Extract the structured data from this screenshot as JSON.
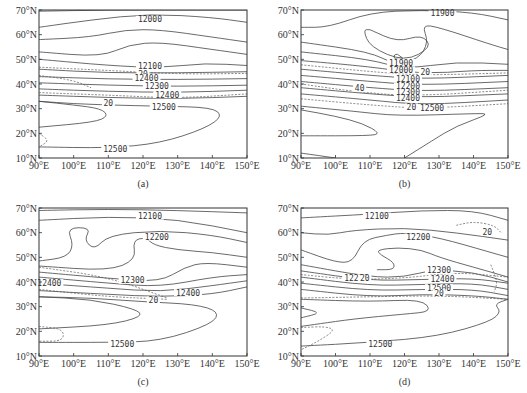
{
  "chart_data": [
    {
      "type": "contour",
      "panel": "a",
      "caption": "(a)",
      "xlim": [
        90,
        150
      ],
      "ylim": [
        10,
        70
      ],
      "xticks": [
        "90°E",
        "100°E",
        "110°E",
        "120°E",
        "130°E",
        "140°E",
        "150°E"
      ],
      "yticks": [
        "10°N",
        "20°N",
        "30°N",
        "40°N",
        "50°N",
        "60°N",
        "70°N"
      ],
      "solid_levels": [
        12000,
        12100,
        12200,
        12300,
        12400,
        12500
      ],
      "dashed_levels": [
        20
      ],
      "labels": [
        {
          "text": "12000",
          "lon": 122,
          "lat": 66
        },
        {
          "text": "12100",
          "lon": 122,
          "lat": 47
        },
        {
          "text": "20",
          "lon": 120,
          "lat": 43.8
        },
        {
          "text": "12400",
          "lon": 121,
          "lat": 42.3
        },
        {
          "text": "12300",
          "lon": 124,
          "lat": 39
        },
        {
          "text": "12400",
          "lon": 127,
          "lat": 35.5
        },
        {
          "text": "20",
          "lon": 110,
          "lat": 32
        },
        {
          "text": "12500",
          "lon": 126,
          "lat": 30.5
        },
        {
          "text": "12500",
          "lon": 112,
          "lat": 13.5
        }
      ]
    },
    {
      "type": "contour",
      "panel": "b",
      "caption": "(b)",
      "xlim": [
        90,
        150
      ],
      "ylim": [
        10,
        70
      ],
      "xticks": [
        "90°E",
        "100°E",
        "110°E",
        "120°E",
        "130°E",
        "140°E",
        "150°E"
      ],
      "yticks": [
        "10°N",
        "20°N",
        "30°N",
        "40°N",
        "50°N",
        "60°N",
        "70°N"
      ],
      "solid_levels": [
        11900,
        12000,
        12100,
        12200,
        12300,
        12400,
        12500
      ],
      "dashed_levels": [
        20,
        40
      ],
      "labels": [
        {
          "text": "11900",
          "lon": 131,
          "lat": 68.5
        },
        {
          "text": "11900",
          "lon": 119,
          "lat": 48.5
        },
        {
          "text": "12000",
          "lon": 119,
          "lat": 45.5
        },
        {
          "text": "20",
          "lon": 126,
          "lat": 44.5
        },
        {
          "text": "12100",
          "lon": 121,
          "lat": 42
        },
        {
          "text": "40",
          "lon": 107,
          "lat": 38
        },
        {
          "text": "12200",
          "lon": 121,
          "lat": 38.8
        },
        {
          "text": "12300",
          "lon": 121,
          "lat": 36.5
        },
        {
          "text": "12400",
          "lon": 121,
          "lat": 34
        },
        {
          "text": "20",
          "lon": 122,
          "lat": 30.5
        },
        {
          "text": "12500",
          "lon": 128,
          "lat": 30
        }
      ]
    },
    {
      "type": "contour",
      "panel": "c",
      "caption": "(c)",
      "xlim": [
        90,
        150
      ],
      "ylim": [
        10,
        70
      ],
      "xticks": [
        "90°E",
        "100°E",
        "110°E",
        "120°E",
        "130°E",
        "140°E",
        "150°E"
      ],
      "yticks": [
        "10°N",
        "20°N",
        "30°N",
        "40°N",
        "50°N",
        "60°N",
        "70°N"
      ],
      "solid_levels": [
        12100,
        12200,
        12300,
        12400,
        12500
      ],
      "dashed_levels": [
        20
      ],
      "labels": [
        {
          "text": "12100",
          "lon": 122,
          "lat": 66.5
        },
        {
          "text": "12200",
          "lon": 124,
          "lat": 58
        },
        {
          "text": "12300",
          "lon": 117,
          "lat": 40.5
        },
        {
          "text": "12400",
          "lon": 93,
          "lat": 39.5
        },
        {
          "text": "12400",
          "lon": 133,
          "lat": 35.5
        },
        {
          "text": "20",
          "lon": 123,
          "lat": 32.5
        },
        {
          "text": "12500",
          "lon": 114,
          "lat": 14.5
        }
      ]
    },
    {
      "type": "contour",
      "panel": "d",
      "caption": "(d)",
      "xlim": [
        90,
        150
      ],
      "ylim": [
        10,
        70
      ],
      "xticks": [
        "90°E",
        "100°E",
        "110°E",
        "120°E",
        "130°E",
        "140°E",
        "150°E"
      ],
      "yticks": [
        "10°N",
        "20°N",
        "30°N",
        "40°N",
        "50°N",
        "60°N",
        "70°N"
      ],
      "solid_levels": [
        12100,
        12200,
        12300,
        12400,
        12500
      ],
      "dashed_levels": [
        20
      ],
      "labels": [
        {
          "text": "12100",
          "lon": 112,
          "lat": 66.5
        },
        {
          "text": "12200",
          "lon": 124,
          "lat": 58
        },
        {
          "text": "20",
          "lon": 144,
          "lat": 60
        },
        {
          "text": "12200",
          "lon": 106,
          "lat": 41.5
        },
        {
          "text": "20",
          "lon": 108.5,
          "lat": 41.3
        },
        {
          "text": "12300",
          "lon": 130,
          "lat": 44.5
        },
        {
          "text": "12400",
          "lon": 131,
          "lat": 41.2
        },
        {
          "text": "12500",
          "lon": 130,
          "lat": 37.5
        },
        {
          "text": "20",
          "lon": 130,
          "lat": 35.5
        },
        {
          "text": "12500",
          "lon": 113,
          "lat": 14.5
        }
      ]
    }
  ]
}
